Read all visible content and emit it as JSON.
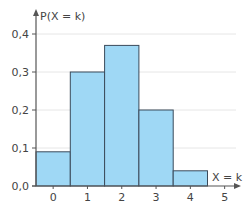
{
  "chart_data": {
    "type": "bar",
    "title": "",
    "xlabel": "X = k",
    "ylabel": "P(X = k)",
    "categories": [
      "0",
      "1",
      "2",
      "3",
      "4"
    ],
    "values": [
      0.09,
      0.3,
      0.37,
      0.2,
      0.04
    ],
    "x_ticks": [
      "0",
      "1",
      "2",
      "3",
      "4",
      "5"
    ],
    "y_ticks": [
      "0,0",
      "0,1",
      "0,2",
      "0,3",
      "0,4"
    ],
    "ylim": [
      0,
      0.45
    ],
    "grid": true,
    "legend": "none",
    "bar_style": "histogram (adjacent bars, width 1)"
  },
  "colors": {
    "bar_fill": "#9fd8f5",
    "bar_stroke": "#3a4a5a",
    "axis": "#555555",
    "grid": "#e6e6e6",
    "text": "#444444"
  }
}
